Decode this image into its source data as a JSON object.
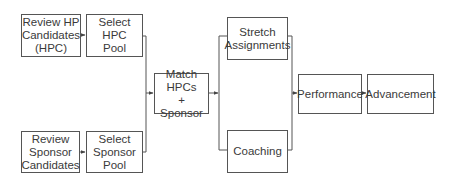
{
  "diagram": {
    "type": "flowchart",
    "nodes": [
      {
        "id": "review_hp",
        "label": "Review HP\nCandidates\n(HPC)"
      },
      {
        "id": "select_hpc",
        "label": "Select HPC\nPool"
      },
      {
        "id": "review_sponsor",
        "label": "Review\nSponsor\nCandidates"
      },
      {
        "id": "select_sponsor",
        "label": "Select\nSponsor\nPool"
      },
      {
        "id": "match",
        "label": "Match HPCs\n+ Sponsor"
      },
      {
        "id": "stretch",
        "label": "Stretch\nAssignments"
      },
      {
        "id": "coaching",
        "label": "Coaching"
      },
      {
        "id": "performance",
        "label": "Performance"
      },
      {
        "id": "advancement",
        "label": "Advancement"
      }
    ],
    "edges": [
      {
        "from": "review_hp",
        "to": "select_hpc"
      },
      {
        "from": "review_sponsor",
        "to": "select_sponsor"
      },
      {
        "from": "select_hpc",
        "to": "match"
      },
      {
        "from": "select_sponsor",
        "to": "match"
      },
      {
        "from": "match",
        "to": "stretch"
      },
      {
        "from": "match",
        "to": "coaching"
      },
      {
        "from": "stretch",
        "to": "performance"
      },
      {
        "from": "coaching",
        "to": "performance"
      },
      {
        "from": "performance",
        "to": "advancement"
      }
    ],
    "colors": {
      "line": "#555555",
      "text": "#3a3a3a",
      "background": "#ffffff"
    }
  }
}
